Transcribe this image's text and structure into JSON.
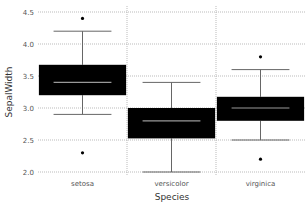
{
  "chart_data": {
    "type": "boxplot",
    "title": "",
    "xlabel": "Species",
    "ylabel": "SepalWidth",
    "ylim": [
      1.95,
      4.55
    ],
    "yticks": [
      "2.0",
      "2.5",
      "3.0",
      "3.5",
      "4.0",
      "4.5"
    ],
    "ytick_values": [
      2.0,
      2.5,
      3.0,
      3.5,
      4.0,
      4.5
    ],
    "grid": true,
    "categories": [
      "setosa",
      "versicolor",
      "virginica"
    ],
    "boxes": [
      {
        "name": "setosa",
        "whisker_low": 2.9,
        "q1": 3.2,
        "median": 3.4,
        "q3": 3.675,
        "whisker_high": 4.2,
        "outliers": [
          4.4,
          2.3
        ]
      },
      {
        "name": "versicolor",
        "whisker_low": 2.0,
        "q1": 2.525,
        "median": 2.8,
        "q3": 3.0,
        "whisker_high": 3.4,
        "outliers": []
      },
      {
        "name": "virginica",
        "whisker_low": 2.5,
        "q1": 2.8,
        "median": 3.0,
        "q3": 3.175,
        "whisker_high": 3.6,
        "outliers": [
          3.8,
          2.2
        ]
      }
    ],
    "colors": {
      "box": "#000000",
      "median": "#999999",
      "whisker": "#666666",
      "grid": "#aaaaaa"
    }
  }
}
